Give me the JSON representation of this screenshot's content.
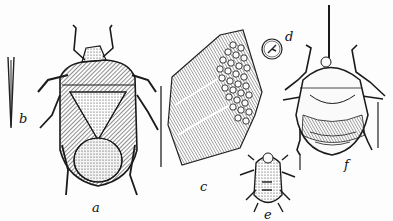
{
  "figure": {
    "labels": {
      "a": "a",
      "b": "b",
      "c": "c",
      "d": "d",
      "e": "e",
      "f": "f"
    },
    "ink_color": "#1a1a1a",
    "paper_color": "#fdfdfd"
  }
}
